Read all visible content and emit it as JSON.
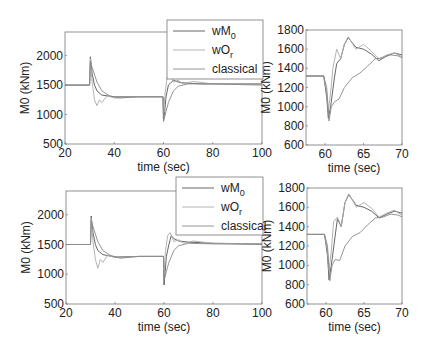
{
  "chart_data": [
    {
      "id": "top_left",
      "type": "line",
      "title": "",
      "xlabel": "time (sec)",
      "ylabel": "M0 (kNm)",
      "xlim": [
        20,
        100
      ],
      "ylim": [
        500,
        2400
      ],
      "xticks": [
        20,
        40,
        60,
        80,
        100
      ],
      "yticks": [
        500,
        1000,
        1500,
        2000
      ],
      "grid": false,
      "legend_position": "top-right",
      "box": {
        "x": 65,
        "y": 32,
        "w": 197,
        "h": 112
      },
      "series": [
        {
          "name": "wM0",
          "color": "#555555",
          "points": [
            [
              20,
              1500
            ],
            [
              30,
              1500
            ],
            [
              30.3,
              1980
            ],
            [
              31,
              1700
            ],
            [
              32,
              1500
            ],
            [
              33,
              1400
            ],
            [
              35,
              1330
            ],
            [
              40,
              1300
            ],
            [
              50,
              1300
            ],
            [
              59.8,
              1300
            ],
            [
              60,
              900
            ],
            [
              60.5,
              1050
            ],
            [
              61,
              1300
            ],
            [
              62,
              1500
            ],
            [
              64,
              1580
            ],
            [
              67,
              1540
            ],
            [
              75,
              1520
            ],
            [
              100,
              1520
            ]
          ]
        },
        {
          "name": "wOr",
          "color": "#aaaaaa",
          "points": [
            [
              20,
              1500
            ],
            [
              30,
              1500
            ],
            [
              30.3,
              1950
            ],
            [
              31,
              1550
            ],
            [
              32,
              1250
            ],
            [
              33,
              1150
            ],
            [
              34,
              1250
            ],
            [
              35,
              1200
            ],
            [
              37,
              1320
            ],
            [
              40,
              1280
            ],
            [
              50,
              1300
            ],
            [
              59.8,
              1300
            ],
            [
              60,
              1000
            ],
            [
              60.6,
              1350
            ],
            [
              61.5,
              1650
            ],
            [
              62.5,
              1700
            ],
            [
              64,
              1550
            ],
            [
              66,
              1580
            ],
            [
              68,
              1520
            ],
            [
              72,
              1560
            ],
            [
              80,
              1520
            ],
            [
              100,
              1510
            ]
          ]
        },
        {
          "name": "classical",
          "color": "#888888",
          "points": [
            [
              20,
              1500
            ],
            [
              30,
              1500
            ],
            [
              30.3,
              1900
            ],
            [
              31,
              1800
            ],
            [
              33,
              1550
            ],
            [
              35,
              1400
            ],
            [
              38,
              1320
            ],
            [
              42,
              1280
            ],
            [
              50,
              1300
            ],
            [
              59.8,
              1300
            ],
            [
              60,
              880
            ],
            [
              61,
              1050
            ],
            [
              62,
              1200
            ],
            [
              64,
              1400
            ],
            [
              66,
              1480
            ],
            [
              70,
              1520
            ],
            [
              80,
              1520
            ],
            [
              100,
              1500
            ]
          ]
        }
      ]
    },
    {
      "id": "top_right",
      "type": "line",
      "title": "",
      "xlabel": "time (sec)",
      "ylabel": "M0 (kNm)",
      "xlim": [
        57.5,
        70
      ],
      "ylim": [
        600,
        1800
      ],
      "xticks": [
        60,
        65,
        70
      ],
      "yticks": [
        600,
        800,
        1000,
        1200,
        1400,
        1600,
        1800
      ],
      "grid": false,
      "box": {
        "x": 306,
        "y": 30,
        "w": 96,
        "h": 115
      },
      "series": [
        {
          "name": "wM0",
          "color": "#555555",
          "points": [
            [
              57.5,
              1320
            ],
            [
              59.8,
              1320
            ],
            [
              60.2,
              1100
            ],
            [
              60.4,
              880
            ],
            [
              60.7,
              1000
            ],
            [
              61.2,
              1300
            ],
            [
              61.5,
              1450
            ],
            [
              62,
              1500
            ],
            [
              62.5,
              1650
            ],
            [
              63,
              1720
            ],
            [
              64,
              1620
            ],
            [
              65,
              1600
            ],
            [
              66,
              1550
            ],
            [
              67,
              1480
            ],
            [
              68,
              1530
            ],
            [
              69,
              1560
            ],
            [
              70,
              1540
            ]
          ]
        },
        {
          "name": "wOr",
          "color": "#aaaaaa",
          "points": [
            [
              57.5,
              1320
            ],
            [
              59.8,
              1320
            ],
            [
              60.2,
              1150
            ],
            [
              60.4,
              950
            ],
            [
              60.7,
              1150
            ],
            [
              61,
              1400
            ],
            [
              61.5,
              1600
            ],
            [
              62,
              1500
            ],
            [
              62.5,
              1650
            ],
            [
              63,
              1730
            ],
            [
              64,
              1600
            ],
            [
              65,
              1650
            ],
            [
              66,
              1580
            ],
            [
              67,
              1500
            ],
            [
              68,
              1540
            ],
            [
              69,
              1560
            ],
            [
              70,
              1520
            ]
          ]
        },
        {
          "name": "classical",
          "color": "#888888",
          "points": [
            [
              57.5,
              1320
            ],
            [
              59.8,
              1320
            ],
            [
              60.2,
              1200
            ],
            [
              60.5,
              850
            ],
            [
              60.8,
              1000
            ],
            [
              61.2,
              1050
            ],
            [
              61.8,
              1080
            ],
            [
              62.5,
              1200
            ],
            [
              63.5,
              1300
            ],
            [
              64.5,
              1350
            ],
            [
              65.5,
              1420
            ],
            [
              66.5,
              1500
            ],
            [
              67.5,
              1510
            ],
            [
              68.5,
              1540
            ],
            [
              69.5,
              1530
            ],
            [
              70,
              1510
            ]
          ]
        }
      ]
    },
    {
      "id": "bottom_left",
      "type": "line",
      "title": "",
      "xlabel": "time (sec)",
      "ylabel": "M0 (kNm)",
      "xlim": [
        20,
        100
      ],
      "ylim": [
        500,
        2400
      ],
      "xticks": [
        20,
        40,
        60,
        80,
        100
      ],
      "yticks": [
        500,
        1000,
        1500,
        2000
      ],
      "grid": false,
      "legend_position": "top-right",
      "box": {
        "x": 66,
        "y": 191,
        "w": 196,
        "h": 113
      },
      "series": [
        {
          "name": "wM0",
          "color": "#555555",
          "points": [
            [
              20,
              1500
            ],
            [
              30,
              1500
            ],
            [
              30.3,
              1980
            ],
            [
              31,
              1700
            ],
            [
              32,
              1500
            ],
            [
              33,
              1400
            ],
            [
              35,
              1330
            ],
            [
              40,
              1290
            ],
            [
              50,
              1300
            ],
            [
              59.8,
              1300
            ],
            [
              60,
              820
            ],
            [
              60.5,
              1050
            ],
            [
              61,
              1300
            ],
            [
              62,
              1500
            ],
            [
              63,
              1650
            ],
            [
              64,
              1600
            ],
            [
              66,
              1560
            ],
            [
              70,
              1540
            ],
            [
              80,
              1520
            ],
            [
              100,
              1510
            ]
          ]
        },
        {
          "name": "wOr",
          "color": "#aaaaaa",
          "points": [
            [
              20,
              1500
            ],
            [
              30,
              1500
            ],
            [
              30.3,
              1950
            ],
            [
              31,
              1550
            ],
            [
              32,
              1250
            ],
            [
              33,
              1100
            ],
            [
              34,
              1250
            ],
            [
              35,
              1200
            ],
            [
              37,
              1320
            ],
            [
              40,
              1280
            ],
            [
              50,
              1300
            ],
            [
              59.8,
              1300
            ],
            [
              60,
              1000
            ],
            [
              60.6,
              1400
            ],
            [
              61.5,
              1650
            ],
            [
              62.5,
              1700
            ],
            [
              64,
              1550
            ],
            [
              66,
              1580
            ],
            [
              68,
              1520
            ],
            [
              72,
              1560
            ],
            [
              80,
              1520
            ],
            [
              100,
              1510
            ]
          ]
        },
        {
          "name": "classical",
          "color": "#888888",
          "points": [
            [
              20,
              1500
            ],
            [
              30,
              1500
            ],
            [
              30.3,
              1900
            ],
            [
              31,
              1800
            ],
            [
              33,
              1550
            ],
            [
              35,
              1400
            ],
            [
              38,
              1320
            ],
            [
              42,
              1270
            ],
            [
              50,
              1300
            ],
            [
              59.8,
              1300
            ],
            [
              60,
              900
            ],
            [
              61,
              1050
            ],
            [
              62,
              1200
            ],
            [
              64,
              1400
            ],
            [
              66,
              1480
            ],
            [
              70,
              1520
            ],
            [
              80,
              1510
            ],
            [
              100,
              1500
            ]
          ]
        }
      ]
    },
    {
      "id": "bottom_right",
      "type": "line",
      "title": "",
      "xlabel": "time (sec)",
      "ylabel": "M0 (kNm)",
      "xlim": [
        57.5,
        70
      ],
      "ylim": [
        600,
        1800
      ],
      "xticks": [
        60,
        65,
        70
      ],
      "yticks": [
        600,
        800,
        1000,
        1200,
        1400,
        1600,
        1800
      ],
      "grid": false,
      "box": {
        "x": 307,
        "y": 188,
        "w": 95,
        "h": 116
      },
      "series": [
        {
          "name": "wM0",
          "color": "#555555",
          "points": [
            [
              57.5,
              1320
            ],
            [
              59.8,
              1320
            ],
            [
              60.2,
              1100
            ],
            [
              60.4,
              850
            ],
            [
              60.7,
              1000
            ],
            [
              61.2,
              1300
            ],
            [
              61.5,
              1480
            ],
            [
              62,
              1400
            ],
            [
              62.5,
              1650
            ],
            [
              63,
              1730
            ],
            [
              64,
              1620
            ],
            [
              65,
              1600
            ],
            [
              66,
              1560
            ],
            [
              67,
              1490
            ],
            [
              68,
              1530
            ],
            [
              69,
              1560
            ],
            [
              70,
              1540
            ]
          ]
        },
        {
          "name": "wOr",
          "color": "#aaaaaa",
          "points": [
            [
              57.5,
              1320
            ],
            [
              59.8,
              1320
            ],
            [
              60.2,
              1150
            ],
            [
              60.4,
              950
            ],
            [
              60.7,
              1150
            ],
            [
              61,
              1450
            ],
            [
              61.5,
              1500
            ],
            [
              62,
              1400
            ],
            [
              62.5,
              1650
            ],
            [
              63,
              1740
            ],
            [
              64,
              1600
            ],
            [
              65,
              1650
            ],
            [
              66,
              1590
            ],
            [
              67,
              1500
            ],
            [
              68,
              1540
            ],
            [
              69,
              1570
            ],
            [
              70,
              1520
            ]
          ]
        },
        {
          "name": "classical",
          "color": "#888888",
          "points": [
            [
              57.5,
              1320
            ],
            [
              59.8,
              1320
            ],
            [
              60.2,
              1200
            ],
            [
              60.5,
              840
            ],
            [
              60.8,
              1000
            ],
            [
              61.2,
              1060
            ],
            [
              61.8,
              1050
            ],
            [
              62.5,
              1200
            ],
            [
              63.5,
              1300
            ],
            [
              64.5,
              1340
            ],
            [
              65.5,
              1420
            ],
            [
              66.5,
              1490
            ],
            [
              67.5,
              1500
            ],
            [
              68.5,
              1530
            ],
            [
              69.5,
              1520
            ],
            [
              70,
              1500
            ]
          ]
        }
      ]
    }
  ],
  "legends": [
    {
      "box": {
        "x": 167,
        "y": 20,
        "w": 96,
        "h": 59
      },
      "entries": [
        {
          "label": "wM",
          "sub": "0"
        },
        {
          "label": "wO",
          "sub": "r"
        },
        {
          "label": "classical",
          "sub": ""
        }
      ]
    },
    {
      "box": {
        "x": 176,
        "y": 177,
        "w": 87,
        "h": 58
      },
      "entries": [
        {
          "label": "wM",
          "sub": "0"
        },
        {
          "label": "wO",
          "sub": "r"
        },
        {
          "label": "classical",
          "sub": ""
        }
      ]
    }
  ]
}
